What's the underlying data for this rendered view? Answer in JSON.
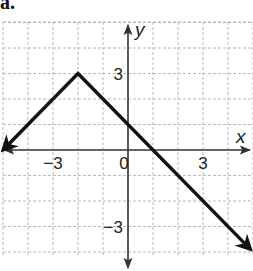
{
  "problem_label": "a.",
  "chart_data": {
    "type": "line",
    "title": "",
    "xlabel": "x",
    "ylabel": "y",
    "xlim": [
      -5,
      5
    ],
    "ylim": [
      -4.5,
      5
    ],
    "grid": true,
    "x_tick_labels": [
      {
        "value": -3,
        "label": "−3"
      },
      {
        "value": 0,
        "label": "0"
      },
      {
        "value": 3,
        "label": "3"
      }
    ],
    "y_tick_labels": [
      {
        "value": 3,
        "label": "3"
      },
      {
        "value": -3,
        "label": "−3"
      }
    ],
    "series": [
      {
        "name": "y = -|x + 2| + 3",
        "points": [
          [
            -5,
            0
          ],
          [
            -2,
            3
          ],
          [
            4.9,
            -3.9
          ]
        ],
        "arrow_start": true,
        "arrow_end": true,
        "color": "#111111"
      }
    ],
    "vertex": [
      -2,
      3
    ],
    "intercepts": {
      "y_intercept": 1,
      "x_intercepts": [
        -5,
        1
      ]
    }
  },
  "colors": {
    "grid": "#b8b8b8",
    "axis": "#333333",
    "curve": "#111111"
  }
}
